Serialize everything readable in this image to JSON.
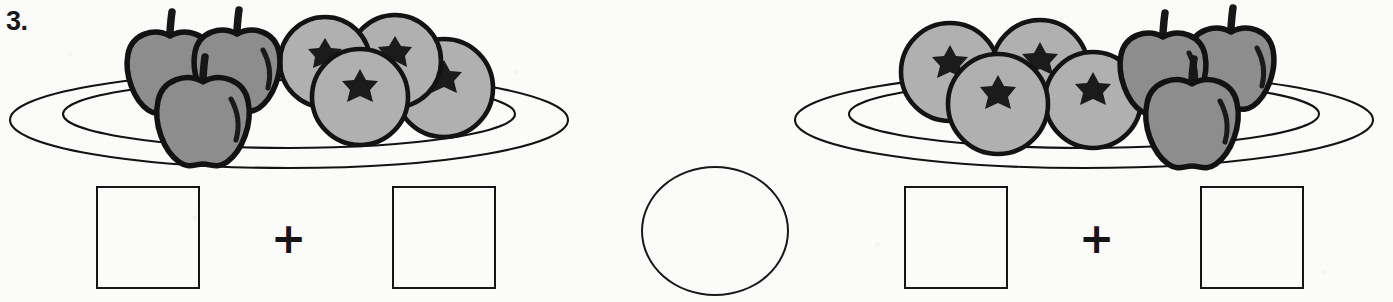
{
  "worksheet": {
    "problem_number": "3.",
    "plus_symbol": "+",
    "colors": {
      "ink": "#131314",
      "apple_fill": "#8d8d8d",
      "orange_fill": "#b0b0b0",
      "paper": "#fbfbfa"
    }
  },
  "left_group": {
    "name": "left-plate-group",
    "plate": {
      "label": "plate",
      "rims": 2
    },
    "fruit": {
      "apples": {
        "label": "apples",
        "count": 3,
        "shade": "dark",
        "position": "left"
      },
      "oranges": {
        "label": "oranges",
        "count": 4,
        "shade": "light",
        "position": "right"
      },
      "total": 7
    },
    "answer": {
      "box_a_value": "",
      "box_b_value": "",
      "box_a_placeholder": "",
      "box_b_placeholder": "",
      "operator": "+"
    }
  },
  "right_group": {
    "name": "right-plate-group",
    "plate": {
      "label": "plate",
      "rims": 2
    },
    "fruit": {
      "oranges": {
        "label": "oranges",
        "count": 4,
        "shade": "light",
        "position": "left"
      },
      "apples": {
        "label": "apples",
        "count": 3,
        "shade": "dark",
        "position": "right"
      },
      "total": 7
    },
    "answer": {
      "box_a_value": "",
      "box_b_value": "",
      "box_a_placeholder": "",
      "box_b_placeholder": "",
      "operator": "+"
    }
  },
  "comparison": {
    "name": "comparison-circle",
    "value": "",
    "placeholder": ""
  }
}
